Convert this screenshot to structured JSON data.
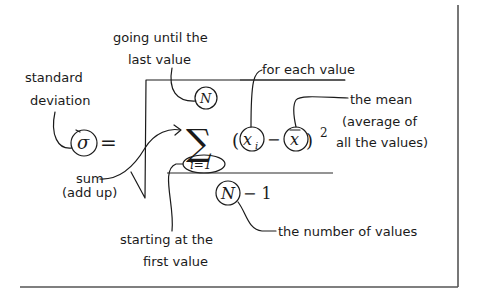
{
  "diagram": {
    "formula": {
      "sigma": "σ",
      "equals": "=",
      "sum_symbol": "∑",
      "upper_limit": "N",
      "lower_limit": "i=1",
      "open_paren": "(",
      "x_i_base": "x",
      "x_i_sub": "i",
      "minus": "−",
      "x_bar": "x",
      "close_paren": ")",
      "exponent": "2",
      "denominator_N": "N",
      "denominator_rest": "− 1"
    },
    "annotations": {
      "standard_deviation": [
        "standard",
        "deviation"
      ],
      "going_until": [
        "going until the",
        "last value"
      ],
      "for_each_value": "for each value",
      "the_mean": [
        "the mean",
        "(average of",
        "all the values)"
      ],
      "sum": [
        "sum",
        "(add up)"
      ],
      "starting_at": [
        "starting at the",
        "first value"
      ],
      "number_of_values": "the number of values"
    },
    "colors": {
      "ink": "#1a1a1a",
      "frame": "#555555",
      "background": "#ffffff"
    }
  }
}
